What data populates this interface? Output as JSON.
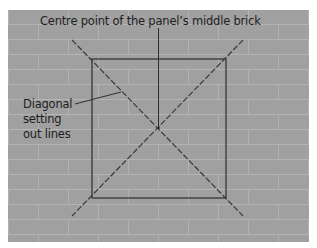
{
  "diagram": {
    "title_label": "Centre point of the panel’s middle brick",
    "side_label": {
      "lines": [
        "Diagonal",
        "setting",
        "out lines"
      ]
    },
    "colors": {
      "background": "#ffffff",
      "brick": "#a0a0a0",
      "mortar": "#b4b4b4",
      "panel_outline": "#4a4a4a",
      "setting_lines": "#3a3a3a",
      "text": "#1e1e1e"
    },
    "elements": [
      "brick wall background (running bond)",
      "square panel outline",
      "two dashed diagonal setting-out lines crossing at panel centre",
      "vertical leader line from title label to centre point",
      "leader line from side label to diagonal"
    ]
  }
}
